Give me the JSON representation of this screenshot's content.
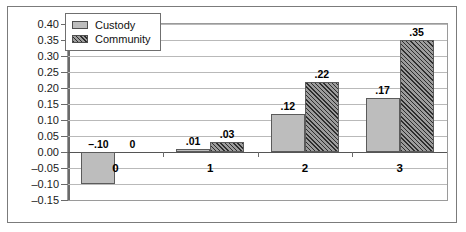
{
  "chart_data": {
    "type": "bar",
    "title": "",
    "subtitle": "",
    "xlabel": "",
    "ylabel": "",
    "categories": [
      "0",
      "1",
      "2",
      "3"
    ],
    "series": [
      {
        "name": "Custody",
        "values": [
          -0.1,
          0.01,
          0.12,
          0.17
        ],
        "labels": [
          "-.10",
          ".01",
          ".12",
          ".17"
        ],
        "fill": "solid-gray",
        "color": "#bdbdbd"
      },
      {
        "name": "Community",
        "values": [
          0,
          0.03,
          0.22,
          0.35
        ],
        "labels": [
          "0",
          ".03",
          ".22",
          ".35"
        ],
        "fill": "diagonal-hatch",
        "color": "#6d6d6d"
      }
    ],
    "ylim": [
      -0.15,
      0.4
    ],
    "ytick_step": 0.05,
    "ytick_labels": [
      "0.40",
      "0.35",
      "0.30",
      "0.25",
      "0.20",
      "0.15",
      "0.10",
      "0.05",
      "0.00",
      "-0.05",
      "-0.10",
      "-0.15"
    ],
    "ytick_values": [
      0.4,
      0.35,
      0.3,
      0.25,
      0.2,
      0.15,
      0.1,
      0.05,
      0.0,
      -0.05,
      -0.1,
      -0.15
    ],
    "grid": true,
    "grid_axis": "y",
    "legend": {
      "position": "top-left",
      "entries": [
        "Custody",
        "Community"
      ]
    }
  }
}
